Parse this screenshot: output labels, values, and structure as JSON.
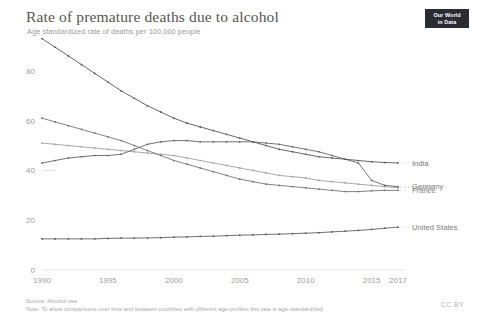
{
  "header": {
    "title": "Rate of premature deaths due to alcohol",
    "subtitle": "Age standardized rate of deaths per 100,000 people"
  },
  "logo": {
    "line1": "Our World",
    "line2": "in Data",
    "name": "our-world-in-data-logo",
    "background": "#2b2b32",
    "color": "#ffffff"
  },
  "footer": {
    "source": "Source: Alcohol use",
    "note": "Note: To allow comparisons over time and between countries with different age-profiles this rate is age-standardized",
    "license": "CC BY"
  },
  "chart_data": {
    "type": "line",
    "title": "Rate of premature deaths due to alcohol",
    "subtitle": "Age standardized rate of deaths per 100,000 people",
    "xlabel": "",
    "ylabel": "Age standardized rate of deaths per 100,000 people",
    "xlim": [
      1990,
      2017
    ],
    "ylim": [
      0,
      90
    ],
    "yticks": [
      0,
      20,
      40,
      60,
      80
    ],
    "xticks": [
      1990,
      1995,
      2000,
      2005,
      2010,
      2015,
      2017
    ],
    "grid": false,
    "legend_position": "right-inline",
    "x": [
      1990,
      1991,
      1992,
      1993,
      1994,
      1995,
      1996,
      1997,
      1998,
      1999,
      2000,
      2001,
      2002,
      2003,
      2004,
      2005,
      2006,
      2007,
      2008,
      2009,
      2010,
      2011,
      2012,
      2013,
      2014,
      2015,
      2016,
      2017
    ],
    "series": [
      {
        "name": "India",
        "color": "#4c4c4c",
        "label_color": "#6e6e6e",
        "values": [
          93.0,
          89.5,
          86.0,
          82.5,
          79.0,
          75.5,
          72.0,
          69.0,
          66.0,
          63.5,
          61.0,
          59.0,
          57.5,
          56.0,
          54.5,
          53.0,
          51.5,
          50.0,
          48.5,
          47.5,
          46.5,
          45.5,
          45.0,
          44.5,
          44.0,
          43.5,
          43.2,
          43.0
        ]
      },
      {
        "name": "World",
        "color": "#9a9a9a",
        "label_color": "#c2c2c2",
        "values": [
          51.0,
          50.5,
          50.0,
          49.5,
          49.0,
          48.5,
          48.0,
          47.5,
          47.0,
          46.5,
          46.0,
          45.0,
          44.0,
          43.0,
          42.0,
          41.0,
          40.0,
          39.0,
          38.0,
          37.5,
          37.0,
          36.0,
          35.5,
          35.0,
          34.5,
          34.0,
          33.5,
          33.0
        ]
      },
      {
        "name": "France",
        "color": "#6b6b6b",
        "label_color": "#8c8c8c",
        "values": [
          61.0,
          59.5,
          58.0,
          56.5,
          55.0,
          53.5,
          52.0,
          50.0,
          48.0,
          46.0,
          44.0,
          42.5,
          41.0,
          39.5,
          38.0,
          36.5,
          35.5,
          34.5,
          34.0,
          33.5,
          33.0,
          32.5,
          32.0,
          31.5,
          31.5,
          31.8,
          32.0,
          32.0
        ]
      },
      {
        "name": "Germany",
        "color": "#5a5a5a",
        "label_color": "#7d7d7d",
        "values": [
          43.0,
          44.0,
          45.0,
          45.5,
          46.0,
          46.0,
          46.5,
          48.5,
          50.5,
          51.5,
          52.0,
          52.0,
          51.5,
          51.5,
          51.5,
          51.5,
          51.5,
          51.0,
          50.5,
          49.5,
          48.5,
          47.5,
          46.0,
          44.5,
          43.0,
          36.0,
          34.0,
          33.5
        ]
      },
      {
        "name": "United States",
        "color": "#555555",
        "label_color": "#7d7d7d",
        "values": [
          12.5,
          12.5,
          12.5,
          12.5,
          12.5,
          12.7,
          12.8,
          12.8,
          12.9,
          13.0,
          13.2,
          13.3,
          13.5,
          13.6,
          13.8,
          14.0,
          14.1,
          14.3,
          14.4,
          14.6,
          14.8,
          15.0,
          15.3,
          15.6,
          15.9,
          16.3,
          16.8,
          17.2
        ]
      }
    ]
  }
}
